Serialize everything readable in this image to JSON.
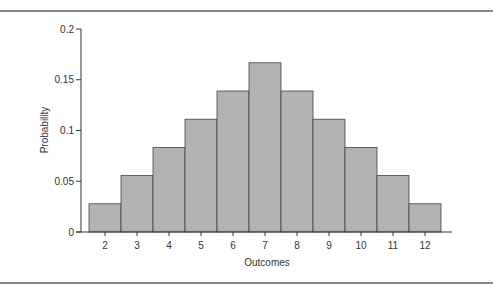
{
  "chart_data": {
    "type": "bar",
    "title": "",
    "xlabel": "Outcomes",
    "ylabel": "Probability",
    "categories": [
      "2",
      "3",
      "4",
      "5",
      "6",
      "7",
      "8",
      "9",
      "10",
      "11",
      "12"
    ],
    "values": [
      0.0278,
      0.0556,
      0.0833,
      0.1111,
      0.1389,
      0.1667,
      0.1389,
      0.1111,
      0.0833,
      0.0556,
      0.0278
    ],
    "ylim": [
      0,
      0.2
    ],
    "yticks": [
      "0",
      "0.05",
      "0.1",
      "0.15",
      "0.2"
    ],
    "grid": false,
    "legend": null,
    "bar_color": "#b3b3b3",
    "bar_edge_color": "#444444"
  }
}
